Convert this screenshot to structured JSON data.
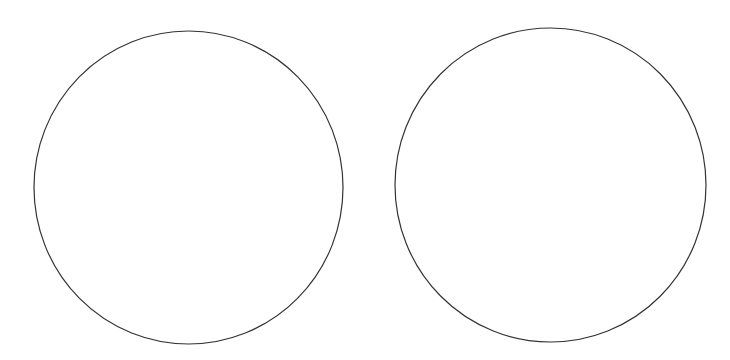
{
  "canvas": {
    "width": 730,
    "height": 360,
    "background": "#ffffff"
  },
  "stroke_color": "#333333",
  "shapes": [
    {
      "type": "circle",
      "cx": 188.5,
      "cy": 187.5,
      "rx": 154.5,
      "ry": 156.5
    },
    {
      "type": "circle",
      "cx": 550.5,
      "cy": 185,
      "rx": 155.5,
      "ry": 157
    }
  ]
}
